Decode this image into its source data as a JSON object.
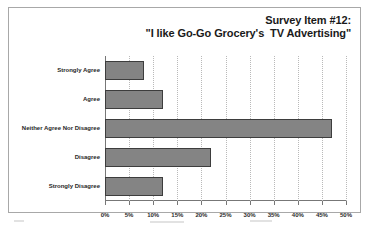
{
  "chart_data": {
    "type": "bar",
    "orientation": "horizontal",
    "title": "Survey Item #12:\n\"I like Go-Go Grocery's  TV Advertising\"",
    "title_lines": [
      "Survey Item #12:",
      "\"I like Go-Go Grocery's  TV Advertising\""
    ],
    "categories": [
      "Strongly Agree",
      "Agree",
      "Neither Agree Nor Disagree",
      "Disagree",
      "Strongly Disagree"
    ],
    "values": [
      8,
      12,
      47,
      22,
      12
    ],
    "xlabel": "",
    "ylabel": "",
    "xlim": [
      0,
      50
    ],
    "xtick_labels": [
      "0%",
      "5%",
      "10%",
      "15%",
      "20%",
      "25%",
      "30%",
      "35%",
      "40%",
      "45%",
      "50%"
    ],
    "xtick_values": [
      0,
      5,
      10,
      15,
      20,
      25,
      30,
      35,
      40,
      45,
      50
    ],
    "value_suffix": "%",
    "grid": "vertical-dotted",
    "legend": "none",
    "colors": {
      "bar_fill": "#848484",
      "bar_border": "#3d3d3d",
      "gridline": "#b9b9b9",
      "axis": "#777777",
      "frame_border": "#a8a8a8",
      "background": "#ffffff",
      "text": "#1f1f1f"
    }
  }
}
